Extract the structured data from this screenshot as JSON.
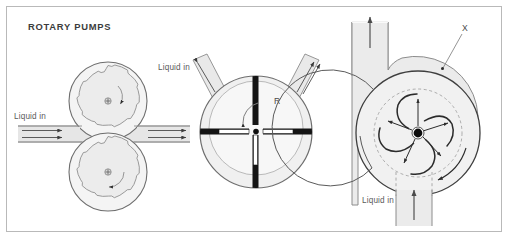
{
  "figure": {
    "title": "ROTARY PUMPS",
    "frame": {
      "border_color": "#b9b9b9",
      "background": "#ffffff"
    },
    "palette": {
      "body_fill": "#ececec",
      "body_fill_light": "#f2f2f2",
      "outline": "#6e6e6e",
      "outline_dark": "#404040",
      "vane_black": "#1a1a1a",
      "hub_black": "#101010",
      "label_gray": "#5a5a5a",
      "dashed_gray": "#9a9a9a"
    },
    "pumps": [
      {
        "id": "gear-pump",
        "name": "External gear pump",
        "inlet_label": "Liquid in",
        "gear_teeth": 12,
        "gears": 2,
        "rotation_upper": "clockwise",
        "rotation_lower": "counter-clockwise",
        "inlet_arrows": 2,
        "outlet_arrows": 2
      },
      {
        "id": "vane-pump",
        "name": "Sliding vane pump",
        "inlet_label": "Liquid in",
        "rotor_label": "R",
        "vanes": 4,
        "rotation": "counter-clockwise",
        "inlet_arrows": 1,
        "outlet_arrows": 2,
        "feed_arrows": 2
      },
      {
        "id": "centrifugal-pump",
        "name": "Centrifugal pump",
        "inlet_label": "Liquid in",
        "impeller_label": "X",
        "blades": 5,
        "rotation": "clockwise",
        "outlet_arrows": 1,
        "inlet_arrows": 1
      }
    ]
  }
}
